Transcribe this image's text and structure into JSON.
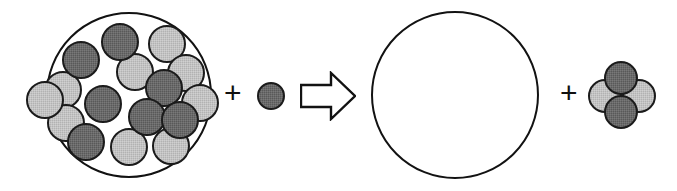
{
  "diagram": {
    "operator_plus": "+",
    "arrow_glyph": "⇨",
    "colors": {
      "dark_nucleon_fill": "#595959",
      "light_nucleon_fill": "#b2b2b2",
      "outline": "#121212",
      "background": "#ffffff"
    },
    "terms": {
      "reactant_nucleus_label": "",
      "reactant_nucleon_label": "",
      "product_nucleus_label": "",
      "product_alpha_label": ""
    },
    "reactant_nucleus": {
      "shell": {
        "cx": 129,
        "cy": 95,
        "r": 83
      },
      "nucleon_radius": 19,
      "nucleons": [
        {
          "cx": 120,
          "cy": 42,
          "shade": "dark"
        },
        {
          "cx": 167,
          "cy": 44,
          "shade": "light"
        },
        {
          "cx": 81,
          "cy": 60,
          "shade": "dark"
        },
        {
          "cx": 135,
          "cy": 72,
          "shade": "light"
        },
        {
          "cx": 186,
          "cy": 73,
          "shade": "light"
        },
        {
          "cx": 63,
          "cy": 90,
          "shade": "light"
        },
        {
          "cx": 164,
          "cy": 88,
          "shade": "dark"
        },
        {
          "cx": 200,
          "cy": 103,
          "shade": "light"
        },
        {
          "cx": 103,
          "cy": 104,
          "shade": "dark"
        },
        {
          "cx": 66,
          "cy": 123,
          "shade": "light"
        },
        {
          "cx": 147,
          "cy": 117,
          "shade": "dark"
        },
        {
          "cx": 180,
          "cy": 120,
          "shade": "dark"
        },
        {
          "cx": 86,
          "cy": 142,
          "shade": "dark"
        },
        {
          "cx": 129,
          "cy": 147,
          "shade": "light"
        },
        {
          "cx": 171,
          "cy": 146,
          "shade": "light"
        },
        {
          "cx": 45,
          "cy": 100,
          "shade": "light"
        }
      ]
    },
    "incoming_nucleon": {
      "cx": 271,
      "cy": 96,
      "r": 14,
      "shade": "dark"
    },
    "plus_left": {
      "x": 233,
      "y": 95
    },
    "arrow": {
      "x": 300,
      "y": 71,
      "width": 56,
      "height": 50
    },
    "product_nucleus": {
      "shell": {
        "cx": 455,
        "cy": 95,
        "r": 84
      }
    },
    "plus_right": {
      "x": 569,
      "y": 95
    },
    "alpha_particle": {
      "nucleon_radius": 17,
      "nucleons": [
        {
          "cx": 605,
          "cy": 96,
          "shade": "light"
        },
        {
          "cx": 639,
          "cy": 96,
          "shade": "light"
        },
        {
          "cx": 621,
          "cy": 78,
          "shade": "dark"
        },
        {
          "cx": 621,
          "cy": 112,
          "shade": "dark"
        }
      ]
    }
  }
}
